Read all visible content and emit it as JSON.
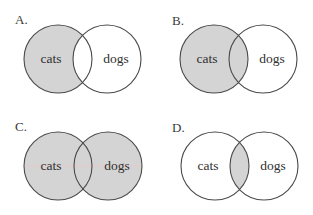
{
  "diagram": {
    "type": "venn-options",
    "colors": {
      "shade": "#d4d4d4",
      "stroke": "#4a4a4a",
      "background": "#ffffff",
      "text": "#2f2f2f",
      "guide_line": "#e8c9c9"
    },
    "radius": 34,
    "panels": [
      {
        "label": "A.",
        "label_pos": [
          15,
          13
        ],
        "left": {
          "cx": 58,
          "cy": 59,
          "text": "cats"
        },
        "right": {
          "cx": 107,
          "cy": 59,
          "text": "dogs"
        },
        "shaded": "left-only",
        "guide_line": false
      },
      {
        "label": "B.",
        "label_pos": [
          172,
          14
        ],
        "left": {
          "cx": 214,
          "cy": 59,
          "text": "cats"
        },
        "right": {
          "cx": 263,
          "cy": 59,
          "text": "dogs"
        },
        "shaded": "left-all",
        "guide_line": false
      },
      {
        "label": "C.",
        "label_pos": [
          15,
          120
        ],
        "left": {
          "cx": 58,
          "cy": 166,
          "text": "cats"
        },
        "right": {
          "cx": 108,
          "cy": 166,
          "text": "dogs"
        },
        "shaded": "union",
        "guide_line": true
      },
      {
        "label": "D.",
        "label_pos": [
          172,
          121
        ],
        "left": {
          "cx": 215,
          "cy": 166,
          "text": "cats"
        },
        "right": {
          "cx": 264,
          "cy": 166,
          "text": "dogs"
        },
        "shaded": "intersection",
        "guide_line": false
      }
    ]
  }
}
